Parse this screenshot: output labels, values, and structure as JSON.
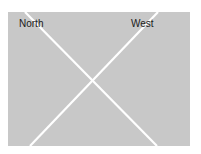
{
  "diagram": {
    "labels": {
      "north": "North",
      "west": "West"
    },
    "colors": {
      "background": "#ffffff",
      "panel": "#c8c8c8",
      "lines": "#ffffff",
      "text": "#1a1a1a"
    }
  }
}
